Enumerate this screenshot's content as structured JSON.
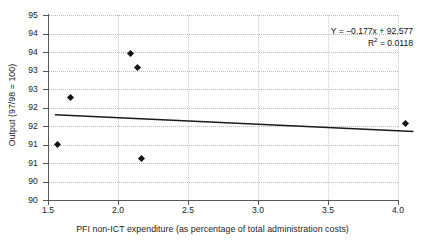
{
  "chart_data": {
    "type": "scatter",
    "title": "",
    "xlabel": "PFI non-ICT expenditure (as percentage of total administration costs)",
    "ylabel": "Output (97/98 = 100)",
    "xlim": [
      1.5,
      4.05
    ],
    "ylim": [
      90,
      95
    ],
    "grid": true,
    "legend": null,
    "x_ticks": [
      {
        "value": 1.5,
        "label": "1.5"
      },
      {
        "value": 2.0,
        "label": "2.0"
      },
      {
        "value": 2.5,
        "label": "2.5"
      },
      {
        "value": 3.0,
        "label": "3.0"
      },
      {
        "value": 3.5,
        "label": "3.5"
      },
      {
        "value": 4.0,
        "label": "4.0"
      }
    ],
    "y_ticks": [
      {
        "value": 95.0,
        "label": "95"
      },
      {
        "value": 94.5,
        "label": "94"
      },
      {
        "value": 94.0,
        "label": "94"
      },
      {
        "value": 93.5,
        "label": "93"
      },
      {
        "value": 93.0,
        "label": "93"
      },
      {
        "value": 92.5,
        "label": "92"
      },
      {
        "value": 92.0,
        "label": "92"
      },
      {
        "value": 91.5,
        "label": "91"
      },
      {
        "value": 91.0,
        "label": "91"
      },
      {
        "value": 90.5,
        "label": "90"
      },
      {
        "value": 90.0,
        "label": "90"
      }
    ],
    "points": [
      {
        "x": 1.57,
        "y": 91.51
      },
      {
        "x": 1.66,
        "y": 92.78
      },
      {
        "x": 2.09,
        "y": 93.95
      },
      {
        "x": 2.14,
        "y": 93.57
      },
      {
        "x": 2.17,
        "y": 91.11
      },
      {
        "x": 4.05,
        "y": 92.07
      }
    ],
    "trendline": {
      "slope": -0.177,
      "intercept": 92.577,
      "x_start": 1.55,
      "x_end": 4.11,
      "color": "#1a1a1a"
    },
    "annotation": {
      "equation_prefix": "Y = −0.177x + 92.577",
      "r_squared_symbol": "R",
      "r_squared_exponent": "2",
      "r_squared_value": " = 0.0118"
    },
    "colors": {
      "marker": "#111111",
      "trendline": "#1a1a1a",
      "axis": "#55595c",
      "gridline": "#b9b9b9",
      "background": "#ffffff",
      "text": "#1d1d1d"
    }
  }
}
